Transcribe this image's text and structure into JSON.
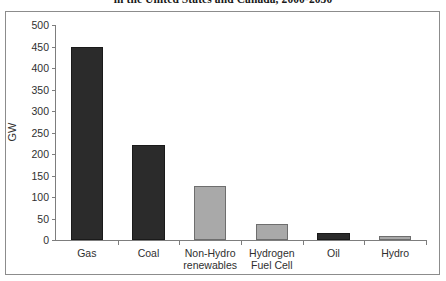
{
  "chart_data": {
    "type": "bar",
    "title": "in the United States and Canada, 2000-2030",
    "xlabel": "",
    "ylabel": "GW",
    "ylim": [
      0,
      500
    ],
    "ytick_step": 50,
    "yticks": [
      500,
      450,
      400,
      350,
      300,
      250,
      200,
      150,
      100,
      50,
      0
    ],
    "grid": false,
    "legend": "none",
    "categories": [
      "Gas",
      "Coal",
      "Non-Hydro\nrenewables",
      "Hydrogen\nFuel Cell",
      "Oil",
      "Hydro"
    ],
    "values": [
      450,
      221,
      125,
      37,
      16,
      10
    ],
    "bar_colors": [
      "#2b2b2b",
      "#2b2b2b",
      "#a9a9a9",
      "#a9a9a9",
      "#2b2b2b",
      "#a9a9a9"
    ],
    "color_dark": "#2b2b2b",
    "color_light": "#a9a9a9",
    "axis_color": "#7d7d7d",
    "frame_color": "#8c8c8c",
    "background": "#ffffff"
  }
}
